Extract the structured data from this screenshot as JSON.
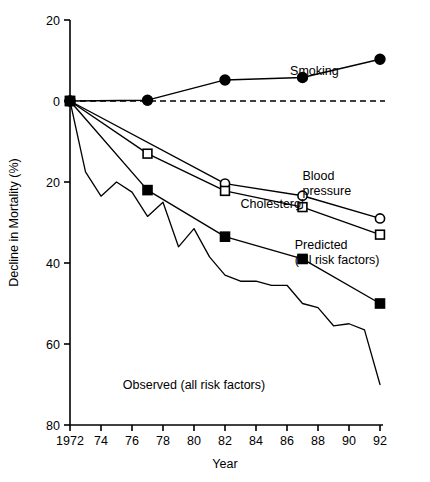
{
  "chart_data": {
    "type": "line",
    "title": "",
    "xlabel": "Year",
    "ylabel": "Decline in Mortality (%)",
    "xlim": [
      1972,
      1992
    ],
    "ylim": [
      -80,
      20
    ],
    "y_axis_note": "Axis is inverted in sign: tick labels are absolute values; downward = decline in mortality",
    "grid": false,
    "legend": "inline-annotations",
    "xticks": [
      1972,
      1974,
      1976,
      1978,
      1980,
      1982,
      1984,
      1986,
      1988,
      1990,
      1992
    ],
    "xtick_labels": [
      "1972",
      "74",
      "76",
      "78",
      "80",
      "82",
      "84",
      "86",
      "88",
      "90",
      "92"
    ],
    "yticks": [
      20,
      0,
      -20,
      -40,
      -60,
      -80
    ],
    "ytick_labels": [
      "20",
      "0",
      "20",
      "40",
      "60",
      "80"
    ],
    "zero_reference_line": {
      "y": 0,
      "style": "dashed"
    },
    "series": [
      {
        "name": "Smoking",
        "marker": "filled-circle",
        "label": "Smoking",
        "label_x": 1986.2,
        "label_y": 6.5,
        "points": [
          {
            "x": 1972,
            "y": 0
          },
          {
            "x": 1977,
            "y": 0.2
          },
          {
            "x": 1982,
            "y": 5.2
          },
          {
            "x": 1987,
            "y": 5.8
          },
          {
            "x": 1992,
            "y": 10.3
          }
        ]
      },
      {
        "name": "Blood pressure",
        "marker": "open-circle",
        "label": "Blood\npressure",
        "label_line1": "Blood",
        "label_line2": "pressure",
        "label_x": 1987.0,
        "label_y": -19.5,
        "points": [
          {
            "x": 1972,
            "y": 0
          },
          {
            "x": 1982,
            "y": -20.4
          },
          {
            "x": 1987,
            "y": -23.4
          },
          {
            "x": 1992,
            "y": -29.0
          }
        ]
      },
      {
        "name": "Cholesterol",
        "marker": "open-square",
        "label": "Cholesterol",
        "label_x": 1983.0,
        "label_y": -26.5,
        "points": [
          {
            "x": 1972,
            "y": 0
          },
          {
            "x": 1977,
            "y": -13.0
          },
          {
            "x": 1982,
            "y": -22.2
          },
          {
            "x": 1987,
            "y": -26.2
          },
          {
            "x": 1992,
            "y": -33.0
          }
        ]
      },
      {
        "name": "Predicted (all risk factors)",
        "marker": "filled-square",
        "label_line1": "Predicted",
        "label_line2": "(all risk factors)",
        "label_x": 1986.5,
        "label_y": -36.5,
        "points": [
          {
            "x": 1972,
            "y": 0
          },
          {
            "x": 1977,
            "y": -22.0
          },
          {
            "x": 1982,
            "y": -33.5
          },
          {
            "x": 1987,
            "y": -39.0
          },
          {
            "x": 1992,
            "y": -50.0
          }
        ]
      },
      {
        "name": "Observed (all risk factors)",
        "marker": "none",
        "label": "Observed (all risk factors)",
        "label_x": 1980.0,
        "label_y": -71.0,
        "points": [
          {
            "x": 1972,
            "y": 0
          },
          {
            "x": 1973,
            "y": -17.5
          },
          {
            "x": 1974,
            "y": -23.5
          },
          {
            "x": 1975,
            "y": -20.0
          },
          {
            "x": 1976,
            "y": -22.5
          },
          {
            "x": 1977,
            "y": -28.5
          },
          {
            "x": 1978,
            "y": -25.0
          },
          {
            "x": 1979,
            "y": -36.0
          },
          {
            "x": 1980,
            "y": -31.5
          },
          {
            "x": 1981,
            "y": -38.5
          },
          {
            "x": 1982,
            "y": -43.0
          },
          {
            "x": 1983,
            "y": -44.5
          },
          {
            "x": 1984,
            "y": -44.5
          },
          {
            "x": 1985,
            "y": -45.5
          },
          {
            "x": 1986,
            "y": -45.5
          },
          {
            "x": 1987,
            "y": -50.0
          },
          {
            "x": 1988,
            "y": -51.0
          },
          {
            "x": 1989,
            "y": -55.5
          },
          {
            "x": 1990,
            "y": -55.0
          },
          {
            "x": 1991,
            "y": -56.5
          },
          {
            "x": 1992,
            "y": -70.0
          }
        ]
      }
    ]
  }
}
